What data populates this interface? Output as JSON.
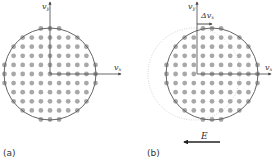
{
  "panels": [
    {
      "id": "a",
      "label": "(a)",
      "axis_y_label": "v",
      "axis_y_sub": "y",
      "axis_x_label": "v",
      "axis_x_sub": "x",
      "origin": [
        50,
        74
      ],
      "circle": {
        "cx": 50,
        "cy": 74,
        "r": 46,
        "style": "solid"
      },
      "dots_center": [
        50,
        74
      ]
    },
    {
      "id": "b",
      "label": "(b)",
      "axis_y_label": "v",
      "axis_y_sub": "y",
      "axis_x_label": "v",
      "axis_x_sub": "x",
      "origin": [
        197,
        74
      ],
      "circle": {
        "cx": 212,
        "cy": 74,
        "r": 46,
        "style": "solid"
      },
      "shadow_circle": {
        "cx": 194,
        "cy": 74,
        "r": 46,
        "style": "dotted"
      },
      "dots_center": [
        212,
        74
      ],
      "shift_label": "Δv",
      "shift_sub": "x",
      "field_label": "E",
      "field_direction": "left"
    }
  ],
  "grid": {
    "spacing": 9.1,
    "dot_radius": 2.4
  },
  "colors": {
    "dot": "#a8a8a8",
    "line": "#555555",
    "dotted": "#bbbbbb",
    "axis": "#444444"
  }
}
